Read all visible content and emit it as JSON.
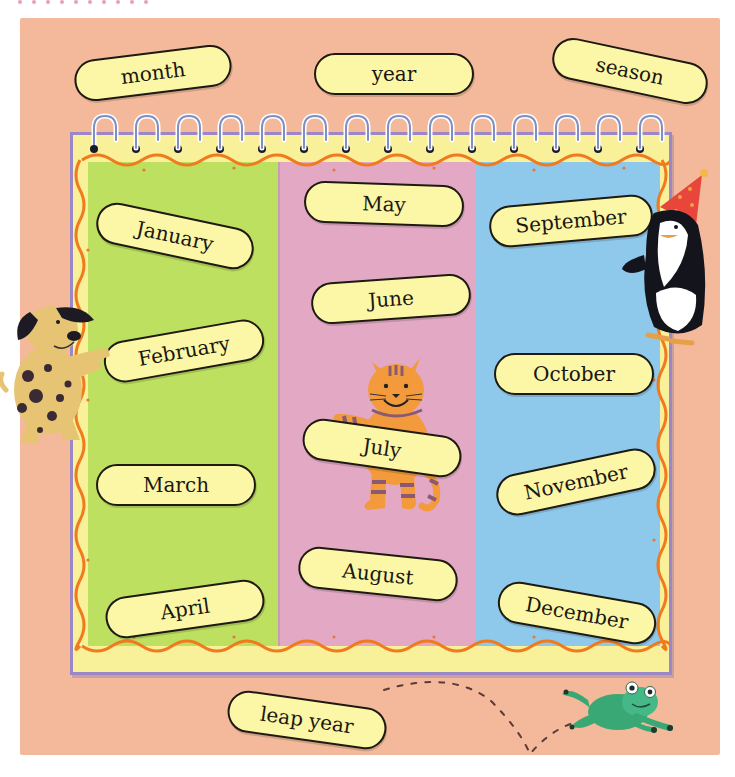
{
  "vocabulary": {
    "top_labels": [
      "month",
      "year",
      "season"
    ],
    "bottom_label": "leap year"
  },
  "calendar": {
    "columns": [
      {
        "color": "#bde060",
        "months": [
          "January",
          "February",
          "March",
          "April"
        ]
      },
      {
        "color": "#e3a8c4",
        "months": [
          "May",
          "June",
          "July",
          "August"
        ]
      },
      {
        "color": "#8ec8ea",
        "months": [
          "September",
          "October",
          "November",
          "December"
        ]
      }
    ],
    "ring_count": 14
  },
  "characters": {
    "dog": "spotted-dog",
    "cat": "striped-cat",
    "penguin": "penguin-with-party-hat",
    "frog": "jumping-frog"
  },
  "colors": {
    "background": "#f3b99a",
    "frame": "#f8f19a",
    "frame_border": "#9b86c6",
    "wavy_border": "#f07a1e",
    "label_fill": "#fbf7a6",
    "label_outline": "#1e1a12"
  }
}
